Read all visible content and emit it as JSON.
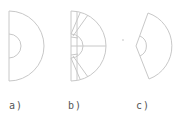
{
  "figure": {
    "panels": [
      {
        "id": "a",
        "label": "a)",
        "description": "semicircle with inner small semicircle"
      },
      {
        "id": "b",
        "label": "b)",
        "description": "semicircle subdivided by radial lines with inner semicircle and horizontal axis"
      },
      {
        "id": "c",
        "label": "c)",
        "description": "circular sector with inner small arc"
      }
    ],
    "stroke_color": "#c8c8c8"
  }
}
